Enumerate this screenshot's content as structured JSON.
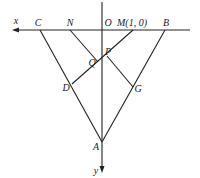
{
  "figure": {
    "rotation_deg": 180,
    "axes": {
      "x_label": "x",
      "y_label": "y",
      "origin_label": "O"
    },
    "points": {
      "A": "A",
      "B": "B",
      "C": "C",
      "D": "D",
      "G": "G",
      "N": "N",
      "M": "M(1, 0)",
      "P": "P",
      "Q": "Q"
    },
    "segments": [
      "AB",
      "AC",
      "MD",
      "NP",
      "PG"
    ],
    "colors": {
      "stroke": "#222222",
      "background": "#ffffff"
    }
  }
}
